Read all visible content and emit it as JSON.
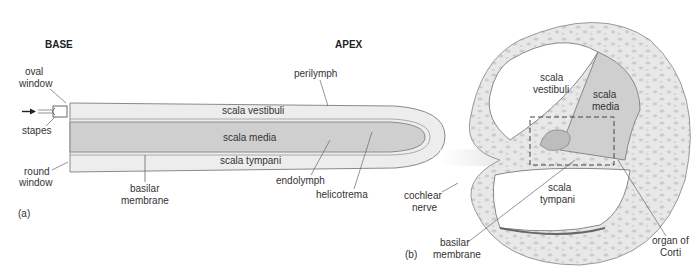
{
  "panel_a": {
    "tag": "(a)",
    "base": "BASE",
    "apex": "APEX",
    "labels": {
      "oval_window_1": "oval",
      "oval_window_2": "window",
      "stapes": "stapes",
      "round_window_1": "round",
      "round_window_2": "window",
      "scala_vestibuli": "scala vestibuli",
      "scala_media": "scala media",
      "scala_tympani": "scala tympani",
      "basilar_1": "basilar",
      "basilar_2": "membrane",
      "perilymph": "perilymph",
      "endolymph": "endolymph",
      "helicotrema": "helicotrema"
    }
  },
  "panel_b": {
    "tag": "(b)",
    "labels": {
      "sv_1": "scala",
      "sv_2": "vestibuli",
      "sm_1": "scala",
      "sm_2": "media",
      "st_1": "scala",
      "st_2": "tympani",
      "nerve_1": "cochlear",
      "nerve_2": "nerve",
      "basilar_1": "basilar",
      "basilar_2": "membrane",
      "corti_1": "organ of",
      "corti_2": "Corti"
    }
  },
  "colors": {
    "perilymph_fill": "#ececec",
    "media_fill": "#cfcfcf",
    "bone_fill": "#e6e6e6",
    "bone_spots": "#cdcdcd",
    "outline": "#8a8a8a"
  }
}
